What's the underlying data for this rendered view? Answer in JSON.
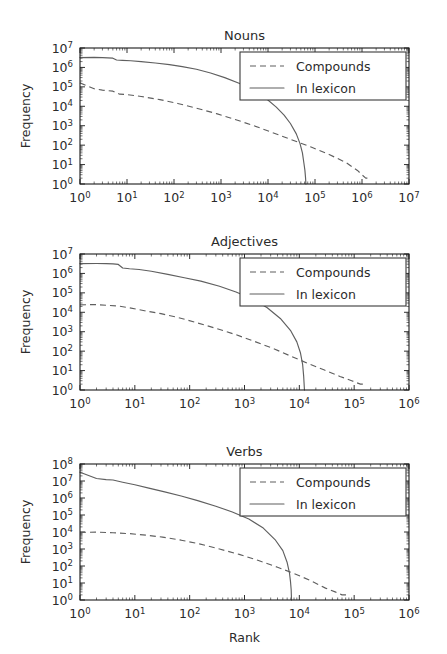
{
  "figure": {
    "width": 447,
    "height": 654,
    "background": "#ffffff",
    "line_color": "#5f5f5f",
    "axis_color": "#1a1a1a",
    "text_color": "#2b2b2b",
    "xlabel": "Rank",
    "ylabel": "Frequency",
    "legend": {
      "entries": [
        {
          "label": "Compounds",
          "style": "dashed"
        },
        {
          "label": "In lexicon",
          "style": "solid"
        }
      ]
    }
  },
  "chart_data": [
    {
      "type": "line",
      "title": "Nouns",
      "xlabel": "",
      "ylabel": "Frequency",
      "xscale": "log",
      "yscale": "log",
      "xlim": [
        1,
        10000000
      ],
      "ylim": [
        1,
        10000000
      ],
      "xticks": [
        1,
        10,
        100,
        1000,
        10000,
        100000,
        1000000,
        10000000
      ],
      "xticklabels": [
        "10^0",
        "10^1",
        "10^2",
        "10^3",
        "10^4",
        "10^5",
        "10^6",
        "10^7"
      ],
      "yticks": [
        1,
        10,
        100,
        1000,
        10000,
        100000,
        1000000,
        10000000
      ],
      "yticklabels": [
        "10^0",
        "10^1",
        "10^2",
        "10^3",
        "10^4",
        "10^5",
        "10^6",
        "10^7"
      ],
      "grid": false,
      "legend_position": "upper right",
      "series": [
        {
          "name": "In lexicon",
          "style": "solid",
          "x": [
            1,
            2,
            3,
            5,
            6,
            8,
            12,
            20,
            40,
            80,
            150,
            300,
            600,
            1200,
            2500,
            5000,
            9000,
            15000,
            22000,
            30000,
            40000,
            48000,
            54000,
            58000,
            61000,
            63000,
            64000
          ],
          "y": [
            3200000,
            3300000,
            3200000,
            3000000,
            2400000,
            2300000,
            2200000,
            2000000,
            1700000,
            1400000,
            1100000,
            800000,
            520000,
            300000,
            150000,
            62000,
            26000,
            9000,
            3500,
            1300,
            380,
            120,
            40,
            12,
            5,
            2,
            1
          ]
        },
        {
          "name": "Compounds",
          "style": "dashed",
          "x": [
            1,
            2,
            3,
            5,
            7,
            10,
            20,
            50,
            120,
            300,
            800,
            2000,
            5000,
            12000,
            30000,
            80000,
            200000,
            450000,
            800000,
            1000000,
            1200000,
            1400000
          ],
          "y": [
            160000,
            80000,
            68000,
            60000,
            42000,
            40000,
            32000,
            22000,
            14000,
            8000,
            4200,
            2100,
            1000,
            460,
            200,
            82,
            33,
            13,
            5,
            3,
            2,
            2
          ]
        }
      ]
    },
    {
      "type": "line",
      "title": "Adjectives",
      "xlabel": "",
      "ylabel": "Frequency",
      "xscale": "log",
      "yscale": "log",
      "xlim": [
        1,
        1000000
      ],
      "ylim": [
        1,
        10000000
      ],
      "xticks": [
        1,
        10,
        100,
        1000,
        10000,
        100000,
        1000000
      ],
      "xticklabels": [
        "10^0",
        "10^1",
        "10^2",
        "10^3",
        "10^4",
        "10^5",
        "10^6"
      ],
      "yticks": [
        1,
        10,
        100,
        1000,
        10000,
        100000,
        1000000,
        10000000
      ],
      "yticklabels": [
        "10^0",
        "10^1",
        "10^2",
        "10^3",
        "10^4",
        "10^5",
        "10^6",
        "10^7"
      ],
      "grid": false,
      "legend_position": "upper right",
      "series": [
        {
          "name": "In lexicon",
          "style": "solid",
          "x": [
            1,
            2,
            3,
            4,
            5,
            6,
            8,
            12,
            20,
            40,
            80,
            160,
            350,
            700,
            1400,
            2600,
            4500,
            7000,
            9000,
            10500,
            11500,
            12000,
            12400
          ],
          "y": [
            3200000,
            3250000,
            3200000,
            3100000,
            2900000,
            1900000,
            1750000,
            1600000,
            1300000,
            900000,
            600000,
            400000,
            220000,
            110000,
            48000,
            17000,
            4800,
            1100,
            300,
            80,
            20,
            5,
            1
          ]
        },
        {
          "name": "Compounds",
          "style": "dashed",
          "x": [
            1,
            2,
            3,
            5,
            8,
            15,
            30,
            60,
            130,
            300,
            700,
            1600,
            3500,
            7000,
            14000,
            28000,
            55000,
            90000,
            130000,
            160000
          ],
          "y": [
            24000,
            25000,
            23000,
            21000,
            17000,
            12000,
            8500,
            5500,
            3000,
            1500,
            700,
            300,
            130,
            55,
            24,
            11,
            5,
            3,
            2,
            2
          ]
        }
      ]
    },
    {
      "type": "line",
      "title": "Verbs",
      "xlabel": "Rank",
      "ylabel": "Frequency",
      "xscale": "log",
      "yscale": "log",
      "xlim": [
        1,
        1000000
      ],
      "ylim": [
        1,
        100000000
      ],
      "xticks": [
        1,
        10,
        100,
        1000,
        10000,
        100000,
        1000000
      ],
      "xticklabels": [
        "10^0",
        "10^1",
        "10^2",
        "10^3",
        "10^4",
        "10^5",
        "10^6"
      ],
      "yticks": [
        1,
        10,
        100,
        1000,
        10000,
        100000,
        1000000,
        10000000,
        100000000
      ],
      "yticklabels": [
        "10^0",
        "10^1",
        "10^2",
        "10^3",
        "10^4",
        "10^5",
        "10^6",
        "10^7",
        "10^8"
      ],
      "grid": false,
      "legend_position": "upper right",
      "series": [
        {
          "name": "In lexicon",
          "style": "solid",
          "x": [
            1,
            2,
            3,
            4,
            6,
            10,
            18,
            35,
            70,
            140,
            300,
            600,
            1200,
            2200,
            3600,
            5000,
            6000,
            6600,
            6900,
            7100,
            7200
          ],
          "y": [
            33000000,
            14000000,
            12000000,
            11500000,
            8500000,
            6000000,
            3800000,
            2300000,
            1300000,
            700000,
            330000,
            150000,
            58000,
            17000,
            3600,
            800,
            160,
            40,
            12,
            4,
            1
          ]
        },
        {
          "name": "Compounds",
          "style": "dashed",
          "x": [
            1,
            2,
            4,
            8,
            16,
            32,
            70,
            150,
            350,
            800,
            1800,
            4000,
            8000,
            16000,
            30000,
            45000,
            60000,
            75000
          ],
          "y": [
            9500,
            9800,
            9000,
            8000,
            6500,
            5000,
            3300,
            2000,
            1000,
            480,
            210,
            85,
            36,
            14,
            5,
            3,
            2,
            2
          ]
        }
      ]
    }
  ]
}
